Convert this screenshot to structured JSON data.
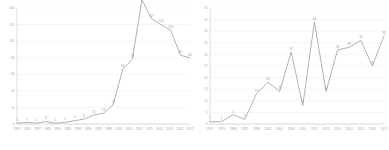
{
  "chart_data": [
    {
      "type": "line",
      "title": "",
      "xlabel": "",
      "ylabel": "",
      "panel": "left",
      "ylim": [
        0,
        140
      ],
      "yticks": [
        0,
        20,
        40,
        60,
        80,
        100,
        120,
        140
      ],
      "grid": true,
      "legend": "none",
      "show_point_labels": true,
      "categories": [
        "1932",
        "1935",
        "1937",
        "1960",
        "1965",
        "1980",
        "1985",
        "1990",
        "1995",
        "1998",
        "2000",
        "2005",
        "2010",
        "2011",
        "2012",
        "2013",
        "2014",
        "2017"
      ],
      "values": [
        1,
        2,
        1,
        3,
        1,
        2,
        4,
        6,
        11,
        13,
        23,
        66,
        78,
        150,
        127,
        120,
        113,
        83,
        80
      ],
      "series": [
        {
          "name": "series-1",
          "color": "#9a9a9a",
          "points": [
            {
              "x": "1932",
              "y": 1,
              "label": "1"
            },
            {
              "x": "1935",
              "y": 2,
              "label": "2"
            },
            {
              "x": "1937",
              "y": 1,
              "label": "1"
            },
            {
              "x": "1960",
              "y": 3,
              "label": "3"
            },
            {
              "x": "1965",
              "y": 1,
              "label": "1"
            },
            {
              "x": "1980",
              "y": 2,
              "label": "2"
            },
            {
              "x": "1985",
              "y": 4,
              "label": "4"
            },
            {
              "x": "1990",
              "y": 6,
              "label": "6"
            },
            {
              "x": "1995",
              "y": 11,
              "label": "11"
            },
            {
              "x": "1998",
              "y": 13,
              "label": "13"
            },
            {
              "x": "2000",
              "y": 23,
              "label": "23"
            },
            {
              "x": "2005",
              "y": 66,
              "label": "66"
            },
            {
              "x": "2010",
              "y": 78,
              "label": "78"
            },
            {
              "x": "2011",
              "y": 150,
              "label": "150"
            },
            {
              "x": "2012",
              "y": 127,
              "label": "127"
            },
            {
              "x": "2013",
              "y": 120,
              "label": "120"
            },
            {
              "x": "2014",
              "y": 113,
              "label": "113"
            },
            {
              "x": "2017",
              "y": 83,
              "label": "83"
            },
            {
              "x": "2017b",
              "y": 80,
              "label": "80"
            }
          ]
        }
      ]
    },
    {
      "type": "line",
      "title": "",
      "xlabel": "",
      "ylabel": "",
      "panel": "right",
      "ylim": [
        0,
        50
      ],
      "yticks": [
        0,
        5,
        10,
        15,
        20,
        25,
        30,
        35,
        40,
        45,
        50
      ],
      "grid": true,
      "legend": "none",
      "show_point_labels": true,
      "categories": [
        "1967",
        "1979",
        "1986",
        "1992",
        "1998",
        "2001",
        "2004",
        "2006",
        "2010",
        "2011",
        "2012",
        "2013",
        "2014",
        "2015",
        "2016",
        "2017"
      ],
      "values": [
        1,
        1,
        4,
        2,
        13,
        18,
        14,
        31,
        8,
        44,
        14,
        32,
        33,
        36,
        25,
        38
      ],
      "series": [
        {
          "name": "series-1",
          "color": "#9a9a9a",
          "points": [
            {
              "x": "1967",
              "y": 1,
              "label": "1"
            },
            {
              "x": "1979",
              "y": 1,
              "label": "1"
            },
            {
              "x": "1986",
              "y": 4,
              "label": "4"
            },
            {
              "x": "1992",
              "y": 2,
              "label": "2"
            },
            {
              "x": "1998",
              "y": 13,
              "label": "13"
            },
            {
              "x": "2001",
              "y": 18,
              "label": "18"
            },
            {
              "x": "2004",
              "y": 14,
              "label": "14"
            },
            {
              "x": "2006",
              "y": 31,
              "label": "31"
            },
            {
              "x": "2010",
              "y": 8,
              "label": "8"
            },
            {
              "x": "2011",
              "y": 44,
              "label": "44"
            },
            {
              "x": "2012",
              "y": 14,
              "label": "14"
            },
            {
              "x": "2013",
              "y": 32,
              "label": "32"
            },
            {
              "x": "2014",
              "y": 33,
              "label": "33"
            },
            {
              "x": "2015",
              "y": 36,
              "label": "36"
            },
            {
              "x": "2016",
              "y": 25,
              "label": "25"
            },
            {
              "x": "2017",
              "y": 38,
              "label": "38"
            }
          ]
        }
      ]
    }
  ]
}
